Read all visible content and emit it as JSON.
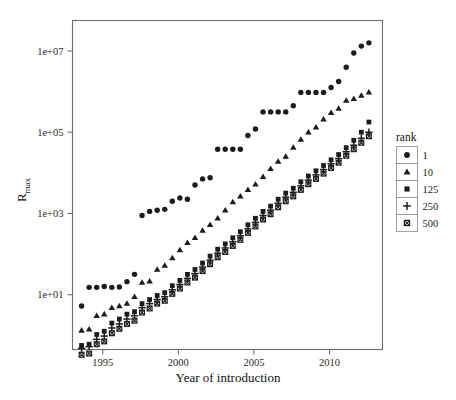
{
  "chart_data": {
    "type": "scatter",
    "title": "",
    "xlabel": "Year of introduction",
    "ylabel": "R_max",
    "ylabel_base": "R",
    "ylabel_sub": "max",
    "yscale": "log10",
    "xlim": [
      1993.0,
      2013.5
    ],
    "ylim_log10": [
      -0.35,
      7.75
    ],
    "xticks": [
      1995,
      2000,
      2005,
      2010
    ],
    "xtick_labels": [
      "1995",
      "2000",
      "2005",
      "2010"
    ],
    "yticks_log10": [
      1,
      3,
      5,
      7
    ],
    "ytick_labels": [
      "1e+01",
      "1e+03",
      "1e+05",
      "1e+07"
    ],
    "grid": false,
    "legend": {
      "title": "rank",
      "position": "right",
      "entries": [
        {
          "label": "1",
          "marker": "circle"
        },
        {
          "label": "10",
          "marker": "triangle"
        },
        {
          "label": "125",
          "marker": "square"
        },
        {
          "label": "250",
          "marker": "plus"
        },
        {
          "label": "500",
          "marker": "crossed-square"
        }
      ]
    },
    "series": [
      {
        "name": "1",
        "marker": "circle",
        "points": [
          [
            1993.6,
            0.72
          ],
          [
            1994.1,
            1.18
          ],
          [
            1994.6,
            1.18
          ],
          [
            1995.1,
            1.2
          ],
          [
            1995.6,
            1.18
          ],
          [
            1996.1,
            1.19
          ],
          [
            1996.6,
            1.32
          ],
          [
            1997.1,
            1.5
          ],
          [
            1997.6,
            2.95
          ],
          [
            1998.1,
            3.05
          ],
          [
            1998.6,
            3.08
          ],
          [
            1999.1,
            3.1
          ],
          [
            1999.6,
            3.3
          ],
          [
            2000.1,
            3.38
          ],
          [
            2000.6,
            3.35
          ],
          [
            2001.1,
            3.7
          ],
          [
            2001.6,
            3.85
          ],
          [
            2002.1,
            3.88
          ],
          [
            2002.6,
            4.58
          ],
          [
            2003.1,
            4.58
          ],
          [
            2003.6,
            4.58
          ],
          [
            2004.1,
            4.58
          ],
          [
            2004.6,
            4.92
          ],
          [
            2005.1,
            5.08
          ],
          [
            2005.6,
            5.5
          ],
          [
            2006.1,
            5.5
          ],
          [
            2006.6,
            5.5
          ],
          [
            2007.1,
            5.5
          ],
          [
            2007.6,
            5.65
          ],
          [
            2008.1,
            5.98
          ],
          [
            2008.6,
            5.98
          ],
          [
            2009.1,
            5.98
          ],
          [
            2009.6,
            5.98
          ],
          [
            2010.1,
            6.1
          ],
          [
            2010.6,
            6.25
          ],
          [
            2011.1,
            6.6
          ],
          [
            2011.6,
            6.95
          ],
          [
            2012.1,
            7.12
          ],
          [
            2012.6,
            7.2
          ]
        ]
      },
      {
        "name": "10",
        "marker": "triangle",
        "points": [
          [
            1993.6,
            0.12
          ],
          [
            1994.1,
            0.15
          ],
          [
            1994.6,
            0.48
          ],
          [
            1995.1,
            0.52
          ],
          [
            1995.6,
            0.68
          ],
          [
            1996.1,
            0.72
          ],
          [
            1996.6,
            0.78
          ],
          [
            1997.1,
            0.95
          ],
          [
            1997.6,
            1.3
          ],
          [
            1998.1,
            1.33
          ],
          [
            1998.6,
            1.62
          ],
          [
            1999.1,
            1.72
          ],
          [
            1999.6,
            1.9
          ],
          [
            2000.1,
            2.1
          ],
          [
            2000.6,
            2.28
          ],
          [
            2001.1,
            2.4
          ],
          [
            2001.6,
            2.58
          ],
          [
            2002.1,
            2.72
          ],
          [
            2002.6,
            2.88
          ],
          [
            2003.1,
            3.08
          ],
          [
            2003.6,
            3.28
          ],
          [
            2004.1,
            3.42
          ],
          [
            2004.6,
            3.58
          ],
          [
            2005.1,
            3.72
          ],
          [
            2005.6,
            3.9
          ],
          [
            2006.1,
            4.1
          ],
          [
            2006.6,
            4.28
          ],
          [
            2007.1,
            4.4
          ],
          [
            2007.6,
            4.62
          ],
          [
            2008.1,
            4.82
          ],
          [
            2008.6,
            5.0
          ],
          [
            2009.1,
            5.12
          ],
          [
            2009.6,
            5.32
          ],
          [
            2010.1,
            5.48
          ],
          [
            2010.6,
            5.58
          ],
          [
            2011.1,
            5.78
          ],
          [
            2011.6,
            5.82
          ],
          [
            2012.1,
            5.9
          ],
          [
            2012.6,
            5.98
          ]
        ]
      },
      {
        "name": "125",
        "marker": "square",
        "points": [
          [
            1993.6,
            -0.25
          ],
          [
            1994.1,
            -0.22
          ],
          [
            1994.6,
            0.02
          ],
          [
            1995.1,
            0.1
          ],
          [
            1995.6,
            0.3
          ],
          [
            1996.1,
            0.4
          ],
          [
            1996.6,
            0.52
          ],
          [
            1997.1,
            0.58
          ],
          [
            1997.6,
            0.78
          ],
          [
            1998.1,
            0.88
          ],
          [
            1998.6,
            0.98
          ],
          [
            1999.1,
            1.05
          ],
          [
            1999.6,
            1.22
          ],
          [
            2000.1,
            1.35
          ],
          [
            2000.6,
            1.5
          ],
          [
            2001.1,
            1.62
          ],
          [
            2001.6,
            1.78
          ],
          [
            2002.1,
            1.95
          ],
          [
            2002.6,
            2.12
          ],
          [
            2003.1,
            2.25
          ],
          [
            2003.6,
            2.4
          ],
          [
            2004.1,
            2.55
          ],
          [
            2004.6,
            2.72
          ],
          [
            2005.1,
            2.88
          ],
          [
            2005.6,
            3.05
          ],
          [
            2006.1,
            3.18
          ],
          [
            2006.6,
            3.35
          ],
          [
            2007.1,
            3.5
          ],
          [
            2007.6,
            3.62
          ],
          [
            2008.1,
            3.78
          ],
          [
            2008.6,
            3.92
          ],
          [
            2009.1,
            4.05
          ],
          [
            2009.6,
            4.18
          ],
          [
            2010.1,
            4.32
          ],
          [
            2010.6,
            4.45
          ],
          [
            2011.1,
            4.62
          ],
          [
            2011.6,
            4.8
          ],
          [
            2012.1,
            5.0
          ],
          [
            2012.6,
            5.25
          ]
        ]
      },
      {
        "name": "250",
        "marker": "plus",
        "points": [
          [
            1993.6,
            -0.32
          ],
          [
            1994.1,
            -0.28
          ],
          [
            1994.6,
            -0.1
          ],
          [
            1995.1,
            -0.02
          ],
          [
            1995.6,
            0.18
          ],
          [
            1996.1,
            0.28
          ],
          [
            1996.6,
            0.4
          ],
          [
            1997.1,
            0.48
          ],
          [
            1997.6,
            0.68
          ],
          [
            1998.1,
            0.78
          ],
          [
            1998.6,
            0.88
          ],
          [
            1999.1,
            0.95
          ],
          [
            1999.6,
            1.12
          ],
          [
            2000.1,
            1.25
          ],
          [
            2000.6,
            1.4
          ],
          [
            2001.1,
            1.52
          ],
          [
            2001.6,
            1.68
          ],
          [
            2002.1,
            1.85
          ],
          [
            2002.6,
            2.02
          ],
          [
            2003.1,
            2.15
          ],
          [
            2003.6,
            2.3
          ],
          [
            2004.1,
            2.45
          ],
          [
            2004.6,
            2.62
          ],
          [
            2005.1,
            2.78
          ],
          [
            2005.6,
            2.95
          ],
          [
            2006.1,
            3.08
          ],
          [
            2006.6,
            3.25
          ],
          [
            2007.1,
            3.4
          ],
          [
            2007.6,
            3.52
          ],
          [
            2008.1,
            3.68
          ],
          [
            2008.6,
            3.82
          ],
          [
            2009.1,
            3.95
          ],
          [
            2009.6,
            4.08
          ],
          [
            2010.1,
            4.22
          ],
          [
            2010.6,
            4.35
          ],
          [
            2011.1,
            4.52
          ],
          [
            2011.6,
            4.68
          ],
          [
            2012.1,
            4.85
          ],
          [
            2012.6,
            5.0
          ]
        ]
      },
      {
        "name": "500",
        "marker": "crossed-square",
        "points": [
          [
            1993.6,
            -0.48
          ],
          [
            1994.1,
            -0.45
          ],
          [
            1994.6,
            -0.22
          ],
          [
            1995.1,
            -0.15
          ],
          [
            1995.6,
            0.05
          ],
          [
            1996.1,
            0.16
          ],
          [
            1996.6,
            0.28
          ],
          [
            1997.1,
            0.36
          ],
          [
            1997.6,
            0.56
          ],
          [
            1998.1,
            0.66
          ],
          [
            1998.6,
            0.78
          ],
          [
            1999.1,
            0.85
          ],
          [
            1999.6,
            1.02
          ],
          [
            2000.1,
            1.15
          ],
          [
            2000.6,
            1.3
          ],
          [
            2001.1,
            1.42
          ],
          [
            2001.6,
            1.58
          ],
          [
            2002.1,
            1.75
          ],
          [
            2002.6,
            1.92
          ],
          [
            2003.1,
            2.05
          ],
          [
            2003.6,
            2.2
          ],
          [
            2004.1,
            2.35
          ],
          [
            2004.6,
            2.52
          ],
          [
            2005.1,
            2.68
          ],
          [
            2005.6,
            2.85
          ],
          [
            2006.1,
            2.98
          ],
          [
            2006.6,
            3.15
          ],
          [
            2007.1,
            3.3
          ],
          [
            2007.6,
            3.42
          ],
          [
            2008.1,
            3.58
          ],
          [
            2008.6,
            3.72
          ],
          [
            2009.1,
            3.85
          ],
          [
            2009.6,
            3.98
          ],
          [
            2010.1,
            4.12
          ],
          [
            2010.6,
            4.25
          ],
          [
            2011.1,
            4.42
          ],
          [
            2011.6,
            4.58
          ],
          [
            2012.1,
            4.74
          ],
          [
            2012.6,
            4.9
          ]
        ]
      }
    ]
  },
  "colors": {
    "marker": "#1c1c1c",
    "frame": "#6e6e6e",
    "legend_box": "#9a9a9a",
    "background": "#ffffff",
    "text": "#1a1a1a"
  }
}
